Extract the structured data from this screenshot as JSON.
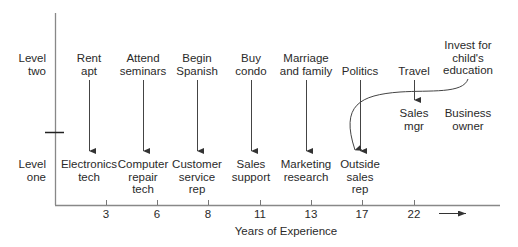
{
  "diagram": {
    "type": "career-path-timeline",
    "y_axis_labels": {
      "level_two": "Level\ntwo",
      "level_one": "Level\none"
    },
    "x_axis": {
      "title": "Years of Experience",
      "ticks": [
        "3",
        "6",
        "8",
        "11",
        "13",
        "17",
        "22"
      ]
    },
    "level_two_events": [
      {
        "label": "Rent\napt",
        "x": 106
      },
      {
        "label": "Attend\nseminars",
        "x": 157
      },
      {
        "label": "Begin\nSpanish",
        "x": 208
      },
      {
        "label": "Buy\ncondo",
        "x": 260
      },
      {
        "label": "Marriage\nand family",
        "x": 311
      },
      {
        "label": "Politics",
        "x": 362
      },
      {
        "label": "Travel",
        "x": 414
      },
      {
        "label": "Invest for\nchild's\neducation",
        "x": 467
      }
    ],
    "level_one_jobs": [
      {
        "label": "Electronics\ntech",
        "x": 106
      },
      {
        "label": "Computer\nrepair\ntech",
        "x": 157
      },
      {
        "label": "Customer\nservice\nrep",
        "x": 208
      },
      {
        "label": "Sales\nsupport",
        "x": 260
      },
      {
        "label": "Marketing\nresearch",
        "x": 311
      },
      {
        "label": "Outside\nsales\nrep",
        "x": 362
      }
    ],
    "upper_jobs": [
      {
        "label": "Sales\nmgr",
        "x": 414
      },
      {
        "label": "Business\nowner",
        "x": 467
      }
    ],
    "colors": {
      "line": "#333333",
      "axis": "#777777",
      "text": "#2a2a2a"
    }
  }
}
